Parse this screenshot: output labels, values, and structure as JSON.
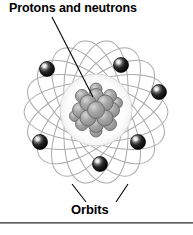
{
  "figure": {
    "kind": "atom-diagram",
    "title_label": "Protons and neutrons",
    "orbits_label": "Orbits",
    "colors": {
      "background": "#ffffff",
      "text": "#000000",
      "orbit_stroke": "#a9a9a9",
      "nucleus_fill": "#9a9a9a",
      "nucleus_stroke": "#6b6b6b",
      "electron_fill": "#1a1a1a",
      "electron_highlight": "#ffffff",
      "leader_line": "#000000",
      "rule": "#5a5a5a"
    },
    "counts": {
      "orbits": 9,
      "electrons": 6,
      "nucleus_particles": 17
    }
  },
  "nucleus": {
    "center": {
      "x": 96,
      "y": 110
    },
    "halo_radius": 36,
    "particles": [
      {
        "cx": 96,
        "cy": 110,
        "r": 8.5
      },
      {
        "cx": 88,
        "cy": 103,
        "r": 8.0
      },
      {
        "cx": 105,
        "cy": 103,
        "r": 8.0
      },
      {
        "cx": 88,
        "cy": 118,
        "r": 8.0
      },
      {
        "cx": 105,
        "cy": 118,
        "r": 8.0
      },
      {
        "cx": 96,
        "cy": 96,
        "r": 7.5
      },
      {
        "cx": 96,
        "cy": 125,
        "r": 7.5
      },
      {
        "cx": 80,
        "cy": 110,
        "r": 7.5
      },
      {
        "cx": 112,
        "cy": 110,
        "r": 7.5
      },
      {
        "cx": 82,
        "cy": 96,
        "r": 6.5
      },
      {
        "cx": 110,
        "cy": 96,
        "r": 6.5
      },
      {
        "cx": 82,
        "cy": 124,
        "r": 6.5
      },
      {
        "cx": 110,
        "cy": 124,
        "r": 6.5
      },
      {
        "cx": 96,
        "cy": 89,
        "r": 6.0
      },
      {
        "cx": 96,
        "cy": 131,
        "r": 6.0
      },
      {
        "cx": 75,
        "cy": 116,
        "r": 5.5
      },
      {
        "cx": 117,
        "cy": 103,
        "r": 5.5
      }
    ]
  },
  "orbits": [
    {
      "rotation": 0,
      "rx": 72,
      "ry": 30
    },
    {
      "rotation": 20,
      "rx": 72,
      "ry": 30
    },
    {
      "rotation": 40,
      "rx": 72,
      "ry": 30
    },
    {
      "rotation": 60,
      "rx": 72,
      "ry": 30
    },
    {
      "rotation": 80,
      "rx": 72,
      "ry": 30
    },
    {
      "rotation": 100,
      "rx": 72,
      "ry": 30
    },
    {
      "rotation": 120,
      "rx": 72,
      "ry": 30
    },
    {
      "rotation": 140,
      "rx": 72,
      "ry": 30
    },
    {
      "rotation": 160,
      "rx": 72,
      "ry": 30
    }
  ],
  "electrons": [
    {
      "id": "electron-upper-left",
      "cx": 47,
      "cy": 69,
      "r": 7.5
    },
    {
      "id": "electron-upper-right",
      "cx": 121,
      "cy": 65,
      "r": 7.5
    },
    {
      "id": "electron-right",
      "cx": 159,
      "cy": 92,
      "r": 7.5
    },
    {
      "id": "electron-lower-left",
      "cx": 40,
      "cy": 142,
      "r": 7.5
    },
    {
      "id": "electron-lower-right",
      "cx": 138,
      "cy": 142,
      "r": 7.5
    },
    {
      "id": "electron-bottom",
      "cx": 100,
      "cy": 164,
      "r": 7.5
    }
  ],
  "leaders": {
    "protons": {
      "x1": 52,
      "y1": 17,
      "x2": 93,
      "y2": 97
    },
    "orbits_left": {
      "x1": 86,
      "y1": 202,
      "x2": 72,
      "y2": 184
    },
    "orbits_right": {
      "x1": 116,
      "y1": 202,
      "x2": 128,
      "y2": 184
    }
  },
  "rule": {
    "y": 222,
    "width": 193,
    "height": 2
  }
}
